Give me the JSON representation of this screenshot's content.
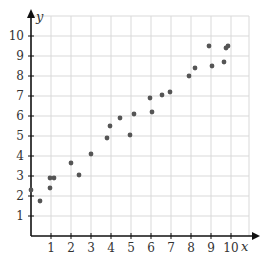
{
  "chart_data": {
    "type": "scatter",
    "title": "",
    "xlabel": "x",
    "ylabel": "y",
    "xlim": [
      0,
      11
    ],
    "ylim": [
      0,
      11
    ],
    "grid": true,
    "legend": null,
    "x_ticks": [
      1,
      2,
      3,
      4,
      5,
      6,
      7,
      8,
      9,
      10
    ],
    "y_ticks": [
      1,
      2,
      3,
      4,
      5,
      6,
      7,
      8,
      9,
      10
    ],
    "series": [
      {
        "name": "points",
        "color": "#555555",
        "points": [
          {
            "x": 0.0,
            "y": 2.3
          },
          {
            "x": 0.45,
            "y": 1.75
          },
          {
            "x": 0.95,
            "y": 2.4
          },
          {
            "x": 0.95,
            "y": 2.9
          },
          {
            "x": 1.15,
            "y": 2.9
          },
          {
            "x": 2.0,
            "y": 3.65
          },
          {
            "x": 2.4,
            "y": 3.05
          },
          {
            "x": 3.0,
            "y": 4.1
          },
          {
            "x": 3.8,
            "y": 4.9
          },
          {
            "x": 3.95,
            "y": 5.5
          },
          {
            "x": 4.45,
            "y": 5.9
          },
          {
            "x": 4.95,
            "y": 5.05
          },
          {
            "x": 5.15,
            "y": 6.1
          },
          {
            "x": 5.95,
            "y": 6.9
          },
          {
            "x": 6.05,
            "y": 6.2
          },
          {
            "x": 6.55,
            "y": 7.05
          },
          {
            "x": 6.95,
            "y": 7.2
          },
          {
            "x": 7.9,
            "y": 8.0
          },
          {
            "x": 8.2,
            "y": 8.4
          },
          {
            "x": 8.9,
            "y": 9.5
          },
          {
            "x": 9.05,
            "y": 8.5
          },
          {
            "x": 9.65,
            "y": 8.7
          },
          {
            "x": 9.75,
            "y": 9.4
          },
          {
            "x": 9.85,
            "y": 9.5
          }
        ]
      }
    ]
  },
  "colors": {
    "grid": "#d9d9d9",
    "axis": "#111111",
    "point": "#555555"
  }
}
